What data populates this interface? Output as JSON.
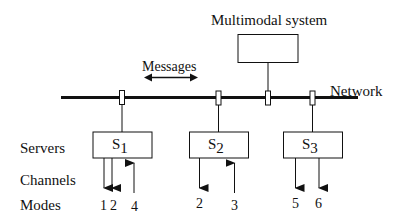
{
  "diagram": {
    "title_labels": {
      "multimodal_system": "Multimodal system",
      "messages": "Messages",
      "network": "Network"
    },
    "row_labels": {
      "servers": "Servers",
      "channels": "Channels",
      "modes": "Modes"
    },
    "servers": [
      {
        "name": "S",
        "subscript": "1",
        "channels": [
          {
            "direction": "out",
            "mode": "1"
          },
          {
            "direction": "out",
            "mode": "2"
          },
          {
            "direction": "in",
            "mode": "4"
          }
        ]
      },
      {
        "name": "S",
        "subscript": "2",
        "channels": [
          {
            "direction": "out",
            "mode": "2"
          },
          {
            "direction": "in",
            "mode": "3"
          }
        ]
      },
      {
        "name": "S",
        "subscript": "3",
        "channels": [
          {
            "direction": "out",
            "mode": "5"
          },
          {
            "direction": "out",
            "mode": "6"
          }
        ]
      }
    ],
    "colors": {
      "line": "#111111",
      "background": "#ffffff"
    }
  }
}
